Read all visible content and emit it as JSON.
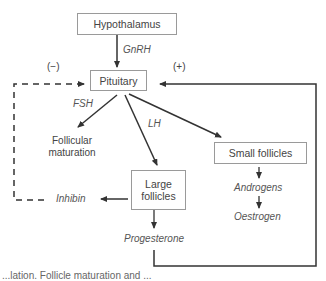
{
  "diagram": {
    "nodes": {
      "hypothalamus": "Hypothalamus",
      "pituitary": "Pituitary",
      "follicular_maturation": "Follicular maturation",
      "small_follicles": "Small follicles",
      "large_follicles": "Large follicles"
    },
    "hormones": {
      "gnrh": "GnRH",
      "fsh": "FSH",
      "lh": "LH",
      "inhibin": "Inhibin",
      "androgens": "Androgens",
      "oestrogen": "Oestrogen",
      "progesterone": "Progesterone"
    },
    "feedback": {
      "negative": "(−)",
      "positive": "(+)"
    },
    "caption_fragment": "...lation. Follicle maturation and ..."
  },
  "colors": {
    "line": "#333333",
    "box_border": "#9a9a9a",
    "text": "#444444"
  }
}
